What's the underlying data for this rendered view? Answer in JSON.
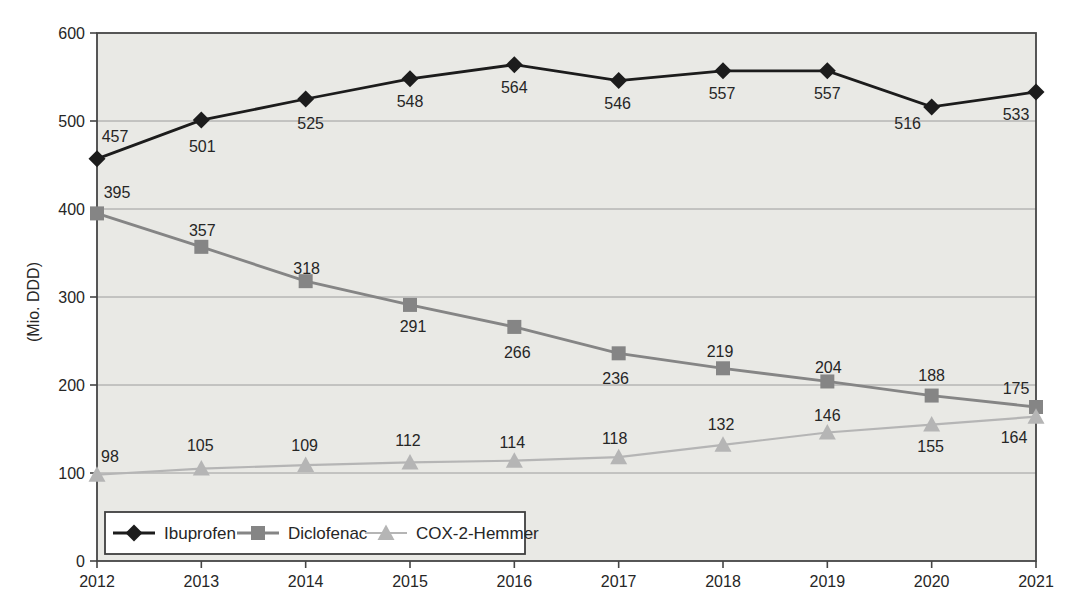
{
  "chart_data": {
    "type": "line",
    "title": "",
    "xlabel": "",
    "ylabel": "(Mio. DDD)",
    "x_categories": [
      "2012",
      "2013",
      "2014",
      "2015",
      "2016",
      "2017",
      "2018",
      "2019",
      "2020",
      "2021"
    ],
    "ylim": [
      0,
      600
    ],
    "yticks": [
      0,
      100,
      200,
      300,
      400,
      500,
      600
    ],
    "grid": "horizontal",
    "legend_position": "inside-bottom-left",
    "series": [
      {
        "name": "Ibuprofen",
        "marker": "diamond",
        "color": "#1c1c1c",
        "line_width": 2.8,
        "values": [
          457,
          501,
          525,
          548,
          564,
          546,
          557,
          557,
          516,
          533
        ],
        "label_offsets": [
          [
            18,
            -22
          ],
          [
            1,
            26
          ],
          [
            5,
            24
          ],
          [
            0,
            23
          ],
          [
            0,
            23
          ],
          [
            -1,
            23
          ],
          [
            -1,
            23
          ],
          [
            0,
            23
          ],
          [
            -24,
            17
          ],
          [
            -20,
            23
          ]
        ]
      },
      {
        "name": "Diclofenac",
        "marker": "square",
        "color": "#858585",
        "line_width": 2.8,
        "values": [
          395,
          357,
          318,
          291,
          266,
          236,
          219,
          204,
          188,
          175
        ],
        "label_offsets": [
          [
            20,
            -21
          ],
          [
            1,
            -16
          ],
          [
            1,
            -13
          ],
          [
            3,
            22
          ],
          [
            3,
            26
          ],
          [
            -3,
            25
          ],
          [
            -3,
            -17
          ],
          [
            1,
            -14
          ],
          [
            0,
            -20
          ],
          [
            -20,
            -19
          ]
        ]
      },
      {
        "name": "COX-2-Hemmer",
        "marker": "triangle",
        "color": "#b5b5b5",
        "line_width": 2.2,
        "values": [
          98,
          105,
          109,
          112,
          114,
          118,
          132,
          146,
          155,
          164
        ],
        "label_offsets": [
          [
            13,
            -18
          ],
          [
            -1,
            -23
          ],
          [
            -1,
            -20
          ],
          [
            -2,
            -22
          ],
          [
            -2,
            -18
          ],
          [
            -4,
            -19
          ],
          [
            -2,
            -20
          ],
          [
            0,
            -17
          ],
          [
            -1,
            22
          ],
          [
            -22,
            21
          ]
        ]
      }
    ]
  },
  "styles": {
    "page_bg": "#ffffff",
    "plot_bg": "#e9e9e5",
    "grid_color": "#9c9c9c",
    "frame_color": "#454545",
    "tick_color": "#454545",
    "label_color": "#262626",
    "legend_bg": "#ffffff",
    "legend_border": "#3f3f3f"
  }
}
